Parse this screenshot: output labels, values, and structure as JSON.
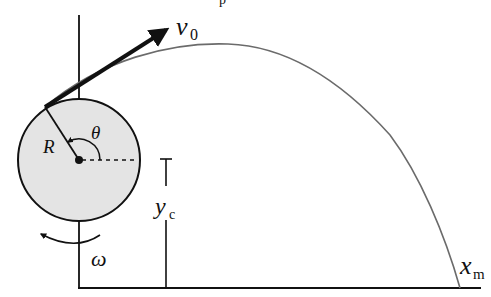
{
  "diagram": {
    "top_cutoff_text": "p",
    "colors": {
      "ink": "#111111",
      "trajectory": "#6b6b6b",
      "wheel_fill": "#e4e4e4",
      "background": "#ffffff"
    },
    "labels": {
      "velocity": "v",
      "velocity_sub": "0",
      "radius": "R",
      "angle": "θ",
      "omega": "ω",
      "height": "y",
      "height_sub": "c",
      "range": "x",
      "range_sub": "m"
    },
    "elements": [
      {
        "name": "wheel",
        "type": "circle",
        "description": "Shaded disk of radius R centered on the vertical axis"
      },
      {
        "name": "vertical-axis",
        "type": "line",
        "description": "Vertical line through wheel center down to ground"
      },
      {
        "name": "ground-line",
        "type": "line",
        "description": "Horizontal ground"
      },
      {
        "name": "radius-line",
        "type": "line",
        "description": "Radius R from center to launch point"
      },
      {
        "name": "horizontal-reference",
        "type": "dashed-line",
        "description": "Dashed horizontal reference from center"
      },
      {
        "name": "theta-arc",
        "type": "arc-arrow",
        "description": "Angle θ measured from horizontal to radius"
      },
      {
        "name": "velocity-vector",
        "type": "arrow",
        "description": "Initial velocity v0 tangent to wheel"
      },
      {
        "name": "trajectory",
        "type": "curve",
        "description": "Parabolic path landing at x_m"
      },
      {
        "name": "yc-marker",
        "type": "dimension",
        "description": "Height of wheel center y_c above ground"
      },
      {
        "name": "omega-arrow",
        "type": "arc-arrow",
        "description": "Wheel rotation ω (counter-clockwise)"
      }
    ]
  }
}
